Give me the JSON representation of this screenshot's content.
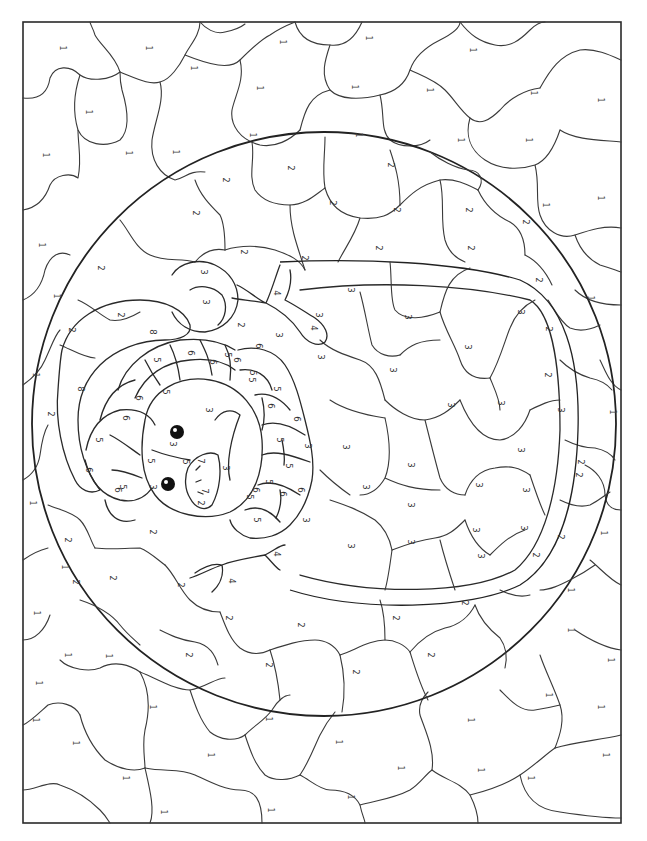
{
  "page": {
    "orientation": "rotated 90 degrees clockwise"
  },
  "legend_numbers": [
    "1",
    "2",
    "3",
    "4",
    "5",
    "6",
    "7",
    "8"
  ],
  "regions": {
    "background": {
      "number": "1",
      "labels": [
        {
          "x": 62,
          "y": 48
        },
        {
          "x": 148,
          "y": 48
        },
        {
          "x": 193,
          "y": 68
        },
        {
          "x": 88,
          "y": 112
        },
        {
          "x": 45,
          "y": 155
        },
        {
          "x": 128,
          "y": 153
        },
        {
          "x": 175,
          "y": 152
        },
        {
          "x": 282,
          "y": 42
        },
        {
          "x": 368,
          "y": 38
        },
        {
          "x": 472,
          "y": 50
        },
        {
          "x": 533,
          "y": 93
        },
        {
          "x": 259,
          "y": 88
        },
        {
          "x": 354,
          "y": 87
        },
        {
          "x": 252,
          "y": 135
        },
        {
          "x": 358,
          "y": 135
        },
        {
          "x": 429,
          "y": 90
        },
        {
          "x": 460,
          "y": 140
        },
        {
          "x": 528,
          "y": 140
        },
        {
          "x": 600,
          "y": 100
        },
        {
          "x": 545,
          "y": 205
        },
        {
          "x": 600,
          "y": 198
        },
        {
          "x": 41,
          "y": 245
        },
        {
          "x": 56,
          "y": 296
        },
        {
          "x": 35,
          "y": 375
        },
        {
          "x": 590,
          "y": 298
        },
        {
          "x": 612,
          "y": 412
        },
        {
          "x": 603,
          "y": 533
        },
        {
          "x": 32,
          "y": 503
        },
        {
          "x": 64,
          "y": 567
        },
        {
          "x": 36,
          "y": 613
        },
        {
          "x": 570,
          "y": 590
        },
        {
          "x": 610,
          "y": 660
        },
        {
          "x": 548,
          "y": 695
        },
        {
          "x": 67,
          "y": 655
        },
        {
          "x": 108,
          "y": 656
        },
        {
          "x": 35,
          "y": 720
        },
        {
          "x": 75,
          "y": 743
        },
        {
          "x": 152,
          "y": 707
        },
        {
          "x": 125,
          "y": 778
        },
        {
          "x": 163,
          "y": 812
        },
        {
          "x": 210,
          "y": 755
        },
        {
          "x": 268,
          "y": 719
        },
        {
          "x": 338,
          "y": 742
        },
        {
          "x": 270,
          "y": 810
        },
        {
          "x": 350,
          "y": 797
        },
        {
          "x": 400,
          "y": 768
        },
        {
          "x": 470,
          "y": 720
        },
        {
          "x": 480,
          "y": 770
        },
        {
          "x": 530,
          "y": 778
        },
        {
          "x": 600,
          "y": 707
        },
        {
          "x": 605,
          "y": 755
        },
        {
          "x": 38,
          "y": 683
        },
        {
          "x": 570,
          "y": 630
        }
      ]
    },
    "ring": {
      "number": "2",
      "labels": [
        {
          "x": 290,
          "y": 168
        },
        {
          "x": 390,
          "y": 165
        },
        {
          "x": 225,
          "y": 180
        },
        {
          "x": 332,
          "y": 203
        },
        {
          "x": 396,
          "y": 210
        },
        {
          "x": 468,
          "y": 210
        },
        {
          "x": 195,
          "y": 213
        },
        {
          "x": 243,
          "y": 252
        },
        {
          "x": 304,
          "y": 258
        },
        {
          "x": 378,
          "y": 248
        },
        {
          "x": 470,
          "y": 248
        },
        {
          "x": 525,
          "y": 222
        },
        {
          "x": 100,
          "y": 268
        },
        {
          "x": 71,
          "y": 330
        },
        {
          "x": 120,
          "y": 315
        },
        {
          "x": 240,
          "y": 325
        },
        {
          "x": 50,
          "y": 414
        },
        {
          "x": 538,
          "y": 280
        },
        {
          "x": 548,
          "y": 329
        },
        {
          "x": 547,
          "y": 375
        },
        {
          "x": 580,
          "y": 462
        },
        {
          "x": 578,
          "y": 475
        },
        {
          "x": 560,
          "y": 537
        },
        {
          "x": 67,
          "y": 540
        },
        {
          "x": 75,
          "y": 582
        },
        {
          "x": 112,
          "y": 578
        },
        {
          "x": 152,
          "y": 532
        },
        {
          "x": 180,
          "y": 585
        },
        {
          "x": 188,
          "y": 655
        },
        {
          "x": 228,
          "y": 618
        },
        {
          "x": 268,
          "y": 665
        },
        {
          "x": 300,
          "y": 625
        },
        {
          "x": 355,
          "y": 672
        },
        {
          "x": 395,
          "y": 618
        },
        {
          "x": 430,
          "y": 655
        },
        {
          "x": 464,
          "y": 603
        },
        {
          "x": 535,
          "y": 555
        },
        {
          "x": 200,
          "y": 503
        }
      ]
    },
    "egg_and_body": {
      "number": "3",
      "labels": [
        {
          "x": 350,
          "y": 290
        },
        {
          "x": 407,
          "y": 317
        },
        {
          "x": 467,
          "y": 347
        },
        {
          "x": 520,
          "y": 312
        },
        {
          "x": 320,
          "y": 357
        },
        {
          "x": 392,
          "y": 370
        },
        {
          "x": 450,
          "y": 405
        },
        {
          "x": 500,
          "y": 403
        },
        {
          "x": 520,
          "y": 450
        },
        {
          "x": 560,
          "y": 410
        },
        {
          "x": 345,
          "y": 447
        },
        {
          "x": 410,
          "y": 465
        },
        {
          "x": 478,
          "y": 485
        },
        {
          "x": 525,
          "y": 490
        },
        {
          "x": 365,
          "y": 487
        },
        {
          "x": 410,
          "y": 505
        },
        {
          "x": 475,
          "y": 530
        },
        {
          "x": 523,
          "y": 528
        },
        {
          "x": 350,
          "y": 546
        },
        {
          "x": 410,
          "y": 542
        },
        {
          "x": 480,
          "y": 556
        },
        {
          "x": 203,
          "y": 272
        },
        {
          "x": 205,
          "y": 302
        },
        {
          "x": 172,
          "y": 444
        },
        {
          "x": 208,
          "y": 410
        },
        {
          "x": 225,
          "y": 468
        },
        {
          "x": 152,
          "y": 487
        },
        {
          "x": 307,
          "y": 446
        },
        {
          "x": 305,
          "y": 520
        },
        {
          "x": 278,
          "y": 335
        },
        {
          "x": 318,
          "y": 315
        }
      ]
    },
    "feet": {
      "number": "4",
      "labels": [
        {
          "x": 276,
          "y": 293
        },
        {
          "x": 313,
          "y": 328
        },
        {
          "x": 231,
          "y": 581
        },
        {
          "x": 276,
          "y": 554
        }
      ]
    },
    "shell_band_a": {
      "number": "5",
      "labels": [
        {
          "x": 156,
          "y": 360
        },
        {
          "x": 165,
          "y": 392
        },
        {
          "x": 227,
          "y": 355
        },
        {
          "x": 98,
          "y": 440
        },
        {
          "x": 122,
          "y": 487
        },
        {
          "x": 150,
          "y": 461
        },
        {
          "x": 252,
          "y": 373
        },
        {
          "x": 251,
          "y": 380
        },
        {
          "x": 276,
          "y": 389
        },
        {
          "x": 279,
          "y": 440
        },
        {
          "x": 288,
          "y": 466
        },
        {
          "x": 268,
          "y": 482
        },
        {
          "x": 256,
          "y": 520
        },
        {
          "x": 249,
          "y": 497
        },
        {
          "x": 185,
          "y": 462
        }
      ]
    },
    "shell_band_b": {
      "number": "6",
      "labels": [
        {
          "x": 190,
          "y": 353
        },
        {
          "x": 212,
          "y": 362
        },
        {
          "x": 138,
          "y": 398
        },
        {
          "x": 125,
          "y": 418
        },
        {
          "x": 88,
          "y": 470
        },
        {
          "x": 117,
          "y": 490
        },
        {
          "x": 258,
          "y": 346
        },
        {
          "x": 270,
          "y": 406
        },
        {
          "x": 296,
          "y": 419
        },
        {
          "x": 300,
          "y": 490
        },
        {
          "x": 282,
          "y": 494
        },
        {
          "x": 255,
          "y": 490
        },
        {
          "x": 236,
          "y": 360
        }
      ]
    },
    "beak": {
      "number": "7",
      "labels": [
        {
          "x": 200,
          "y": 461
        },
        {
          "x": 204,
          "y": 491
        }
      ]
    },
    "wing": {
      "number": "8",
      "labels": [
        {
          "x": 152,
          "y": 332
        },
        {
          "x": 80,
          "y": 389
        }
      ]
    }
  },
  "eyes": [
    {
      "x": 177,
      "y": 432,
      "r": 7
    },
    {
      "x": 168,
      "y": 484,
      "r": 7
    }
  ],
  "colors": {
    "line": "#2a2a2a",
    "paper": "#ffffff",
    "number_text": "#444444"
  }
}
